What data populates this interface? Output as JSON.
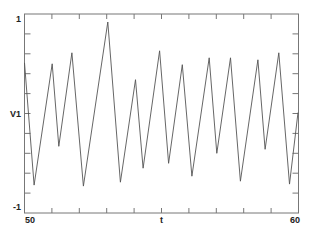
{
  "chart_data": {
    "type": "line",
    "title": "",
    "xlabel": "t",
    "ylabel": "V1",
    "xlim": [
      50,
      60
    ],
    "ylim": [
      -1,
      1
    ],
    "x_tick_labels": [
      "50",
      "60"
    ],
    "y_tick_labels": [
      "1",
      "-1"
    ],
    "x_ticks": [
      50,
      51,
      52,
      53,
      54,
      55,
      56,
      57,
      58,
      59,
      60
    ],
    "y_ticks": [
      -1,
      -0.8,
      -0.6,
      -0.4,
      -0.2,
      0,
      0.2,
      0.4,
      0.6,
      0.8,
      1
    ],
    "grid": false,
    "legend": null,
    "series": [
      {
        "name": "V1",
        "color": "#555555",
        "x": [
          50.0,
          50.35,
          51.01,
          51.25,
          51.73,
          52.15,
          53.04,
          53.5,
          54.05,
          54.33,
          54.93,
          55.26,
          55.76,
          56.11,
          56.74,
          57.02,
          57.52,
          57.88,
          58.52,
          58.78,
          59.28,
          59.67,
          59.98
        ],
        "y": [
          0.51,
          -0.72,
          0.5,
          -0.33,
          0.61,
          -0.73,
          0.92,
          -0.69,
          0.34,
          -0.55,
          0.63,
          -0.5,
          0.49,
          -0.63,
          0.56,
          -0.4,
          0.56,
          -0.68,
          0.54,
          -0.36,
          0.61,
          -0.71,
          0.01
        ]
      }
    ]
  },
  "labels": {
    "ylabel": "V1",
    "xlabel": "t",
    "y_top": "1",
    "y_bottom": "-1",
    "x_left": "50",
    "x_right": "60"
  },
  "colors": {
    "axis": "#777777",
    "line": "#555555",
    "background": "#ffffff"
  }
}
